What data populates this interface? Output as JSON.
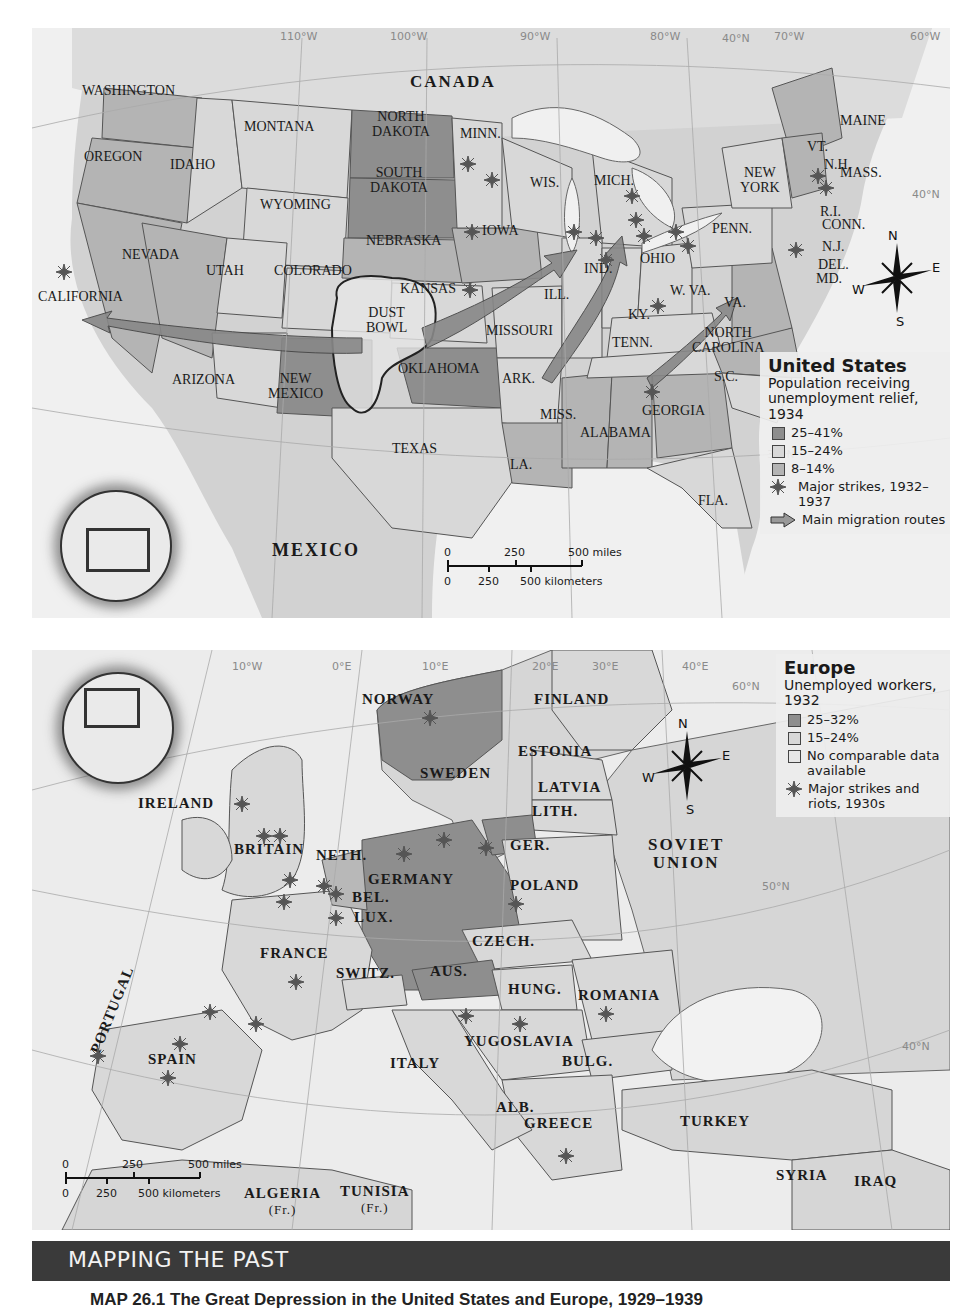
{
  "us_map": {
    "grid_labels": [
      "110°W",
      "100°W",
      "90°W",
      "80°W",
      "40°N",
      "70°W",
      "60°W",
      "40°N",
      "30°N"
    ],
    "region_labels": {
      "canada": "CANADA",
      "mexico": "MEXICO"
    },
    "state_labels": {
      "washington": "WASHINGTON",
      "oregon": "OREGON",
      "idaho": "IDAHO",
      "montana": "MONTANA",
      "north_dakota_1": "NORTH",
      "north_dakota_2": "DAKOTA",
      "south_dakota_1": "SOUTH",
      "south_dakota_2": "DAKOTA",
      "minn": "MINN.",
      "wyoming": "WYOMING",
      "wis": "WIS.",
      "mich": "MICH.",
      "nevada": "NEVADA",
      "utah": "UTAH",
      "colorado": "COLORADO",
      "nebraska": "NEBRASKA",
      "iowa": "IOWA",
      "kansas": "KANSAS",
      "california": "CALIFORNIA",
      "dust_bowl_1": "DUST",
      "dust_bowl_2": "BOWL",
      "missouri": "MISSOURI",
      "ill": "ILL.",
      "ind": "IND.",
      "ohio": "OHIO",
      "penn": "PENN.",
      "new_york_1": "NEW",
      "new_york_2": "YORK",
      "maine": "MAINE",
      "vt": "VT.",
      "nh": "N.H.",
      "mass": "MASS.",
      "ri": "R.I.",
      "conn": "CONN.",
      "nj": "N.J.",
      "del": "DEL.",
      "md": "MD.",
      "w_va": "W. VA.",
      "va": "VA.",
      "ky": "KY.",
      "tenn": "TENN.",
      "north_carolina_1": "NORTH",
      "north_carolina_2": "CAROLINA",
      "arizona": "ARIZONA",
      "new_mexico_1": "NEW",
      "new_mexico_2": "MEXICO",
      "oklahoma": "OKLAHOMA",
      "ark": "ARK.",
      "sc": "S.C.",
      "georgia": "GEORGIA",
      "miss": "MISS.",
      "alabama": "ALABAMA",
      "texas": "TEXAS",
      "la": "LA.",
      "fla": "FLA."
    },
    "compass": {
      "n": "N",
      "s": "S",
      "e": "E",
      "w": "W"
    },
    "scale_bar": {
      "miles": [
        "0",
        "250",
        "500 miles"
      ],
      "km": [
        "0",
        "250",
        "500 kilometers"
      ]
    },
    "legend": {
      "title": "United States",
      "subtitle": "Population receiving unemployment relief, 1934",
      "items": [
        {
          "label": "25–41%",
          "color": "#8e8e8e"
        },
        {
          "label": "15–24%",
          "color": "#d8d8d8"
        },
        {
          "label": "8–14%",
          "color": "#b4b4b4"
        }
      ],
      "strikes_label": "Major strikes, 1932–1937",
      "migration_label": "Main migration routes"
    }
  },
  "eu_map": {
    "grid_labels": [
      "10°W",
      "0°E",
      "10°E",
      "20°E",
      "30°E",
      "40°E",
      "60°N",
      "50°N",
      "40°N"
    ],
    "country_labels": {
      "norway": "NORWAY",
      "finland": "FINLAND",
      "estonia": "ESTONIA",
      "sweden": "SWEDEN",
      "latvia": "LATVIA",
      "lith": "LITH.",
      "ireland": "IRELAND",
      "ger_east": "GER.",
      "britain": "BRITAIN",
      "neth": "NETH.",
      "soviet_1": "SOVIET",
      "soviet_2": "UNION",
      "germany": "GERMANY",
      "bel": "BEL.",
      "lux": "LUX.",
      "poland": "POLAND",
      "czech": "CZECH.",
      "france": "FRANCE",
      "switz": "SWITZ.",
      "aus": "AUS.",
      "hung": "HUNG.",
      "romania": "ROMANIA",
      "portugal": "PORTUGAL",
      "spain": "SPAIN",
      "yugoslavia": "YUGOSLAVIA",
      "italy": "ITALY",
      "bulg": "BULG.",
      "alb": "ALB.",
      "greece": "GREECE",
      "turkey": "TURKEY",
      "syria": "SYRIA",
      "iraq": "IRAQ",
      "algeria": "ALGERIA",
      "algeria_sub": "(Fr.)",
      "tunisia": "TUNISIA",
      "tunisia_sub": "(Fr.)"
    },
    "compass": {
      "n": "N",
      "s": "S",
      "e": "E",
      "w": "W"
    },
    "scale_bar": {
      "miles": [
        "0",
        "250",
        "500 miles"
      ],
      "km": [
        "0",
        "250",
        "500 kilometers"
      ]
    },
    "legend": {
      "title": "Europe",
      "subtitle": "Unemployed workers, 1932",
      "items": [
        {
          "label": "25–32%",
          "color": "#8e8e8e"
        },
        {
          "label": "15–24%",
          "color": "#d8d8d8"
        },
        {
          "label": "No comparable data available",
          "color": "#e6e6e6"
        }
      ],
      "strikes_label": "Major strikes and riots, 1930s"
    }
  },
  "banner": {
    "title": "MAPPING THE PAST"
  },
  "caption": "MAP 26.1 The Great Depression in the United States and Europe, 1929–1939"
}
